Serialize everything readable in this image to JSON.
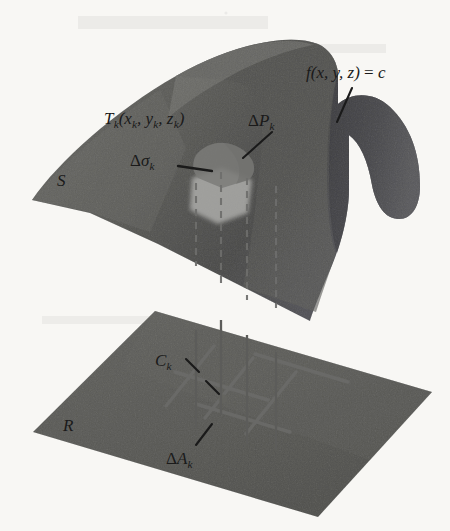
{
  "figure": {
    "domain": "mathematical-diagram",
    "background_color": "#f8f7f4"
  },
  "colors": {
    "surface_light": "#9c9c99",
    "surface_dark": "#86868a",
    "surface_fold": "#8e8e8c",
    "plane": "#9a9a97",
    "patch_dark": "#7a7a78",
    "patch_light": "#b0b0ad",
    "grid_line": "#6f6f6d",
    "projection_line": "#5f5f5d",
    "dashed_line": "#70706e",
    "ink": "#1a1a1a"
  },
  "labels": {
    "level_surface": {
      "text_parts": {
        "fn": "f",
        "args": "(x, y, z)",
        "eq": " = ",
        "c": "c"
      },
      "full": "f(x, y, z) = c",
      "role": "level-surface-equation"
    },
    "tangent_point": {
      "base": "T",
      "sub": "k",
      "args_open": "(x",
      "args_sub1": "k",
      "args_mid1": ", y",
      "args_sub2": "k",
      "args_mid2": ", z",
      "args_sub3": "k",
      "args_close": ")",
      "full": "Tk(xk, yk, zk)",
      "role": "sample-point-on-surface"
    },
    "tangent_patch": {
      "delta": "Δ",
      "base": "P",
      "sub": "k",
      "full": "ΔPk",
      "role": "tangent-plane-patch-area"
    },
    "surface_patch": {
      "delta": "Δ",
      "base": "σ",
      "sub": "k",
      "full": "Δσk",
      "role": "surface-patch-area"
    },
    "surface": {
      "text": "S",
      "role": "surface-name"
    },
    "region": {
      "text": "R",
      "role": "projection-region-name"
    },
    "cell_point": {
      "base": "C",
      "sub": "k",
      "full": "Ck",
      "role": "cell-center-point"
    },
    "cell_area": {
      "delta": "Δ",
      "base": "A",
      "sub": "k",
      "full": "ΔAk",
      "role": "region-cell-area"
    }
  },
  "geometry": {
    "surface_outline": "M 32,200 C 60,160 118,108 178,74 C 236,41 292,33 320,44 C 330,48 336,58 338,70 L 338,104 C 352,92 374,92 390,106 C 410,124 420,152 420,186 C 420,206 412,218 400,218 C 386,218 376,204 372,184 C 368,160 360,142 348,134 L 348,188 C 348,212 340,246 326,276 C 316,300 312,314 310,320 L 244,286 L 160,244 L 92,214 Z",
    "surface_fold": "M 338,70 L 338,104 C 352,92 374,92 390,106 C 410,124 420,152 420,186 C 420,206 412,218 400,218 C 386,218 376,204 372,184 C 368,160 360,142 348,134 L 348,188 C 348,206 344,228 336,252 C 330,232 328,204 328,176 C 328,138 330,98 338,70 Z",
    "surface_shadow_ridge": "M 178,74 C 236,41 292,33 320,44 C 330,48 336,58 338,70 C 330,98 328,138 328,176 C 328,208 330,238 336,252 C 330,268 322,292 316,310 L 244,286 C 252,246 258,196 262,156 C 266,112 258,88 240,82 C 220,76 198,78 178,74 Z",
    "plane_outline": "M 155,311 L 432,392 L 318,517 L 33,432 Z",
    "projection_lines": [
      {
        "x_top": 196,
        "x_bottom": 196,
        "y_surface_top": 182,
        "y_surface_exit": 268,
        "y_plane": 424
      },
      {
        "x_top": 221,
        "x_bottom": 221,
        "y_surface_top": 171,
        "y_surface_exit": 282,
        "y_plane": 416
      },
      {
        "x_top": 247,
        "x_bottom": 247,
        "y_surface_top": 176,
        "y_surface_exit": 296,
        "y_plane": 440
      },
      {
        "x_top": 275,
        "x_bottom": 275,
        "y_surface_top": 183,
        "y_surface_exit": 305,
        "y_plane": 446
      }
    ],
    "grid_lines_count": 6,
    "cell_node": {
      "x": 223,
      "y": 399
    }
  }
}
